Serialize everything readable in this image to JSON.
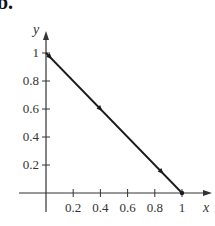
{
  "figure": {
    "part_label": "b."
  },
  "chart_data": {
    "type": "line",
    "title": "",
    "xlabel": "x",
    "ylabel": "y",
    "xlim": [
      0,
      1
    ],
    "ylim": [
      0,
      1
    ],
    "grid": false,
    "x_ticks": [
      "0.2",
      "0.4",
      "0.6",
      "0.8",
      "1"
    ],
    "y_ticks": [
      "0.2",
      "0.4",
      "0.6",
      "0.8",
      "1"
    ],
    "series": [
      {
        "name": "path",
        "x": [
          0,
          1
        ],
        "y": [
          1,
          0
        ],
        "direction_markers": [
          {
            "x": 0.03,
            "y": 0.97
          },
          {
            "x": 0.4,
            "y": 0.6
          },
          {
            "x": 0.85,
            "y": 0.15
          }
        ],
        "endpoint": {
          "x": 1,
          "y": 0
        }
      }
    ],
    "line_color": "#1a1a1a",
    "axis_color": "#333333"
  }
}
